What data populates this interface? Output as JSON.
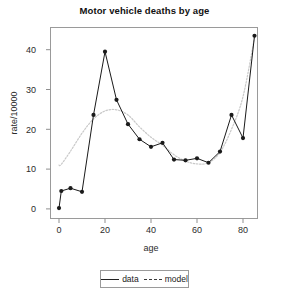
{
  "chart_data": {
    "type": "line",
    "title": "Motor vehicle deaths by age",
    "xlabel": "age",
    "ylabel": "rate/10000",
    "xlim": [
      -4,
      92
    ],
    "ylim": [
      -1.5,
      45.5
    ],
    "xticks": [
      0,
      20,
      40,
      60,
      80
    ],
    "yticks": [
      0,
      10,
      20,
      30,
      40
    ],
    "xticklabels": [
      "0",
      "20",
      "40",
      "60",
      "80"
    ],
    "yticklabels": [
      "0",
      "10",
      "20",
      "30",
      "40"
    ],
    "grid": false,
    "legend_position": "below-axes",
    "frame": true,
    "x": [
      0,
      1,
      5,
      10,
      15,
      20,
      25,
      30,
      35,
      40,
      45,
      50,
      55,
      60,
      65,
      70,
      75,
      80,
      85
    ],
    "series": [
      {
        "name": "data",
        "style": "solid-with-markers",
        "color": "#1a1a1a",
        "marker": "filled-circle",
        "values": [
          0.2,
          4.5,
          5.2,
          4.3,
          23.6,
          39.5,
          27.4,
          21.3,
          17.5,
          15.6,
          16.6,
          12.4,
          12.2,
          12.7,
          11.6,
          14.4,
          23.6,
          17.8,
          43.5
        ]
      },
      {
        "name": "model",
        "style": "dotted",
        "color": "#c9c9c9",
        "marker": "none",
        "values": [
          11.0,
          11.2,
          14.5,
          19.0,
          22.6,
          24.6,
          24.9,
          23.6,
          20.6,
          18.0,
          16.0,
          13.6,
          12.0,
          11.3,
          11.6,
          14.2,
          20.0,
          28.2,
          43.0
        ]
      }
    ]
  },
  "legend": {
    "entries": [
      {
        "label": "data",
        "key": "solid-line-glyph"
      },
      {
        "label": "model",
        "key": "dashed-line-glyph"
      }
    ]
  }
}
